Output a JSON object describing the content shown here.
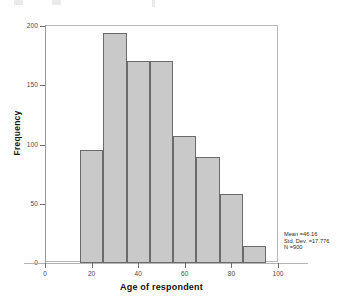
{
  "chart_data": {
    "type": "bar",
    "subtype": "histogram",
    "title": "",
    "xlabel": "Age of respondent",
    "ylabel": "Frequency",
    "xlim": [
      0,
      100
    ],
    "ylim": [
      0,
      200
    ],
    "xticks": [
      0,
      20,
      40,
      60,
      80,
      100
    ],
    "yticks": [
      0,
      50,
      100,
      150,
      200
    ],
    "xtick_labels": [
      "0",
      "20",
      "40",
      "60",
      "80",
      "100"
    ],
    "ytick_labels": [
      "0",
      "50",
      "100",
      "150",
      "200"
    ],
    "grid": false,
    "legend": null,
    "bin_width": 10,
    "bin_edges": [
      15,
      25,
      35,
      45,
      55,
      65,
      75,
      85,
      95
    ],
    "categories": [
      "15-25",
      "25-35",
      "35-45",
      "45-55",
      "55-65",
      "65-75",
      "75-85",
      "85-95"
    ],
    "bin_centers": [
      20,
      30,
      40,
      50,
      60,
      70,
      80,
      90
    ],
    "values": [
      95,
      193,
      170,
      170,
      107,
      89,
      58,
      14
    ],
    "bar_color": "#c9c9c9",
    "bar_edge_color": "#6b6b6b",
    "annotations": {
      "mean_label": "Mean =46.16",
      "std_dev_label": "Std. Dev. =17.776",
      "n_label": "N =900"
    }
  },
  "axes": {
    "y_title": "Frequency",
    "x_title": "Age of respondent"
  },
  "stats": {
    "mean": "Mean =46.16",
    "std_dev": "Std. Dev. =17.776",
    "n": "N =900"
  }
}
